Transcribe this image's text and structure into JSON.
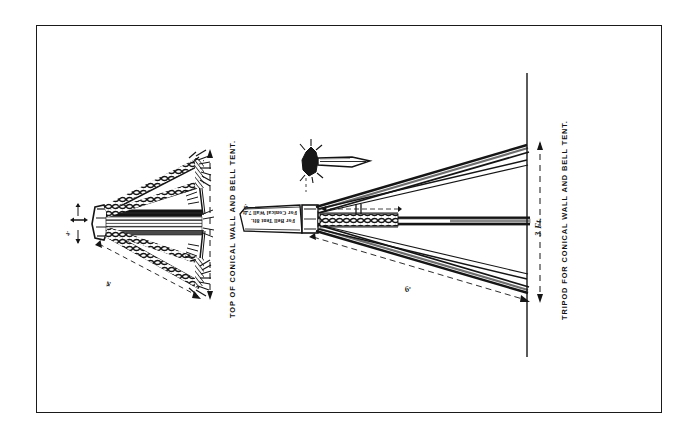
{
  "plate": {
    "title_note": "Plate of tripod construction for conical wall and bell tents",
    "background_color": "#ffffff",
    "ink_color": "#151515",
    "border_color": "#1a1a1a"
  },
  "figures": [
    {
      "id": "figure-left",
      "name": "top-of-conical-wall-and-bell-tent",
      "caption": "TOP OF CONICAL WALL AND BELL TENT.",
      "description": "Side elevation of three lashed poles bound with rope whippings, splaying to the right",
      "dimensions": [
        {
          "label": "4·",
          "name": "dimension-4ft",
          "orientation": "diagonal"
        },
        {
          "label": "4·",
          "name": "dimension-head-height",
          "orientation": "vertical"
        }
      ]
    },
    {
      "id": "figure-right",
      "name": "tripod-for-conical-wall-and-bell-tent",
      "caption": "TRIPOD FOR CONICAL WALL AND BELL TENT.",
      "description": "Plan view of the erected tripod showing spread of legs and overall height reference line",
      "dimensions": [
        {
          "label": "3 Ft.",
          "name": "dimension-3ft",
          "orientation": "vertical"
        },
        {
          "label": "6·",
          "name": "dimension-6ft",
          "orientation": "diagonal"
        },
        {
          "label": "1·5·",
          "name": "dimension-lashing",
          "orientation": "vertical"
        }
      ],
      "notes": [
        {
          "label": "For Conical Wall 7 ft.",
          "name": "note-conical-wall"
        },
        {
          "label": "For Bell Tent 8ft.",
          "name": "note-bell-tent"
        }
      ]
    }
  ],
  "detail": {
    "name": "lashing-head-detail",
    "description": "Small inset detail of the bound tripod head with spike"
  }
}
